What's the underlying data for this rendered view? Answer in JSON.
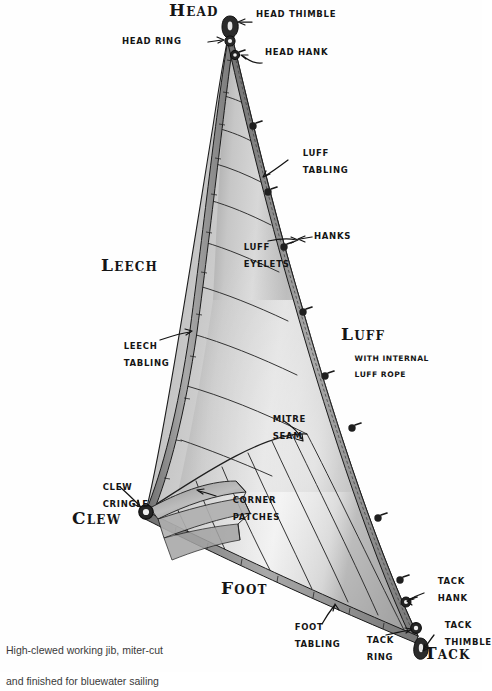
{
  "figure": {
    "subject": "high-clewed working jib",
    "background_color": "#fefefe",
    "ink_color": "#151515",
    "sail_tone_light": "#d9d9d9",
    "sail_tone_mid": "#b4b4b4",
    "sail_tone_dark": "#8a8a8a"
  },
  "caption": {
    "line1": "High-clewed working jib, miter-cut",
    "line2": "and finished for bluewater sailing",
    "full": "High-clewed working jib, miter-cut\nand finished for bluewater sailing"
  },
  "corners": {
    "head": "Head",
    "clew": "Clew",
    "tack": "Tack"
  },
  "edges": {
    "leech": "Leech",
    "luff": "Luff",
    "foot": "Foot",
    "luff_note_line1": "with internal",
    "luff_note_line2": "luff rope"
  },
  "labels": [
    {
      "id": "head-thimble",
      "text": "Head Thimble"
    },
    {
      "id": "head-ring",
      "text": "Head Ring"
    },
    {
      "id": "head-hank",
      "text": "Head Hank"
    },
    {
      "id": "luff-tabling",
      "text": "Luff\nTabling"
    },
    {
      "id": "hanks",
      "text": "Hanks"
    },
    {
      "id": "luff-eyelets",
      "text": "Luff\nEyelets"
    },
    {
      "id": "leech-tabling",
      "text": "Leech\nTabling"
    },
    {
      "id": "mitre-seam",
      "text": "Mitre\nSeam"
    },
    {
      "id": "clew-cringle",
      "text": "Clew\nCringle"
    },
    {
      "id": "corner-patches",
      "text": "Corner\nPatches"
    },
    {
      "id": "foot-tabling",
      "text": "Foot\nTabling"
    },
    {
      "id": "tack-hank",
      "text": "Tack\nHank"
    },
    {
      "id": "tack-thimble",
      "text": "Tack\nThimble"
    },
    {
      "id": "tack-ring",
      "text": "Tack\nRing"
    }
  ],
  "label_text": {
    "head_thimble": "HEAD THIMBLE",
    "head_ring": "HEAD RING",
    "head_hank": "HEAD HANK",
    "luff_tabling_1": "LUFF",
    "luff_tabling_2": "TABLING",
    "hanks": "HANKS",
    "luff_eyelets_1": "LUFF",
    "luff_eyelets_2": "EYELETS",
    "leech_tabling_1": "LEECH",
    "leech_tabling_2": "TABLING",
    "mitre_seam_1": "MITRE",
    "mitre_seam_2": "SEAM",
    "clew_cringle_1": "CLEW",
    "clew_cringle_2": "CRINGLE",
    "corner_patches_1": "CORNER",
    "corner_patches_2": "PATCHES",
    "foot_tabling_1": "FOOT",
    "foot_tabling_2": "TABLING",
    "tack_hank_1": "TACK",
    "tack_hank_2": "HANK",
    "tack_thimble_1": "TACK",
    "tack_thimble_2": "THIMBLE",
    "tack_ring_1": "TACK",
    "tack_ring_2": "RING",
    "luff_with_1": "WITH INTERNAL",
    "luff_with_2": "LUFF ROPE"
  },
  "hardware": {
    "luff_hank_count": 8,
    "head_fittings": [
      "head-thimble",
      "head-ring",
      "head-hank"
    ],
    "tack_fittings": [
      "tack-hank",
      "tack-thimble",
      "tack-ring"
    ],
    "clew_fittings": [
      "clew-cringle"
    ]
  }
}
